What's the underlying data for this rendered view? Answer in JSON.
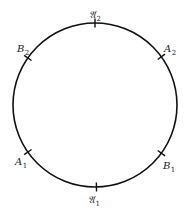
{
  "diagram": {
    "type": "circle-with-marked-points",
    "circle": {
      "cx": 95,
      "cy": 105,
      "r": 82,
      "stroke": "#111111"
    },
    "points": [
      {
        "id": "frak-A2",
        "base": "𝔄",
        "sub": "2",
        "angle_deg": 90,
        "label_x": 89,
        "label_y": 18
      },
      {
        "id": "A2",
        "base": "A",
        "sub": "2",
        "angle_deg": 36,
        "label_x": 164,
        "label_y": 52
      },
      {
        "id": "B2",
        "base": "B",
        "sub": "2",
        "angle_deg": 145,
        "label_x": 17,
        "label_y": 52
      },
      {
        "id": "A1",
        "base": "A",
        "sub": "1",
        "angle_deg": 215,
        "label_x": 15,
        "label_y": 165
      },
      {
        "id": "B1",
        "base": "B",
        "sub": "1",
        "angle_deg": 324,
        "label_x": 163,
        "label_y": 169
      },
      {
        "id": "frak-A1",
        "base": "𝔄",
        "sub": "1",
        "angle_deg": 271,
        "label_x": 88,
        "label_y": 203
      }
    ]
  }
}
